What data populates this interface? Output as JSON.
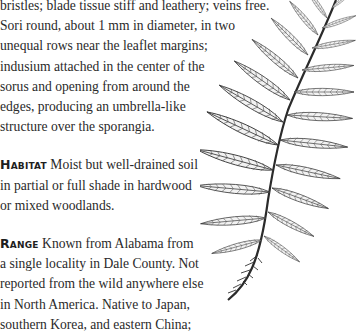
{
  "description": {
    "lines": [
      "bristles; blade tissue stiff and leathery; veins free.",
      "Sori round, about 1 mm in diameter, in two",
      "unequal rows near the leaflet margins;",
      "indusium attached in the center of the",
      "sorus and opening from around the",
      "edges, producing an umbrella-like",
      "structure over the sporangia."
    ]
  },
  "habitat": {
    "label": "Habitat",
    "lines": [
      "Moist but well-drained soil",
      "in partial or full shade in hardwood",
      "or mixed woodlands."
    ]
  },
  "range": {
    "label": "Range",
    "lines": [
      "Known from Alabama from",
      "a single locality in Dale County. Not",
      "reported from the wild anywhere else",
      "in North America. Native to Japan,",
      "southern Korea, and eastern China;"
    ]
  },
  "illustration": {
    "subject": "fern-frond",
    "ink_color": "#3a3a3a"
  }
}
